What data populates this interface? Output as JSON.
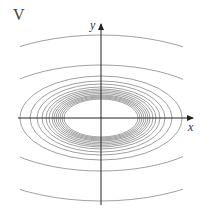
{
  "panel_label": "V",
  "axes": {
    "x_label": "x",
    "y_label": "y",
    "origin": [
      101,
      118
    ],
    "x_range_px": [
      18,
      193
    ],
    "y_range_px": [
      25,
      205
    ]
  },
  "colors": {
    "axis": "#222222",
    "contour": "#888888",
    "background": "#ffffff"
  },
  "contours": {
    "description": "Concentric ellipses centered at origin; tightly packed near inner ellipse, spreading outward (level curves).",
    "full_ellipses": [
      {
        "rx": 37,
        "ry": 19
      },
      {
        "rx": 39,
        "ry": 20
      },
      {
        "rx": 41,
        "ry": 21
      },
      {
        "rx": 43,
        "ry": 22
      },
      {
        "rx": 45,
        "ry": 23
      },
      {
        "rx": 47,
        "ry": 24.5
      },
      {
        "rx": 49,
        "ry": 26
      },
      {
        "rx": 52,
        "ry": 27.5
      },
      {
        "rx": 55,
        "ry": 29
      },
      {
        "rx": 59,
        "ry": 31
      },
      {
        "rx": 64,
        "ry": 34
      },
      {
        "rx": 71,
        "ry": 37
      },
      {
        "rx": 81,
        "ry": 42
      }
    ],
    "clipped_ellipses": [
      {
        "rx": 120,
        "ry": 53
      },
      {
        "rx": 160,
        "ry": 83
      }
    ],
    "clip_x": [
      20,
      183
    ]
  }
}
